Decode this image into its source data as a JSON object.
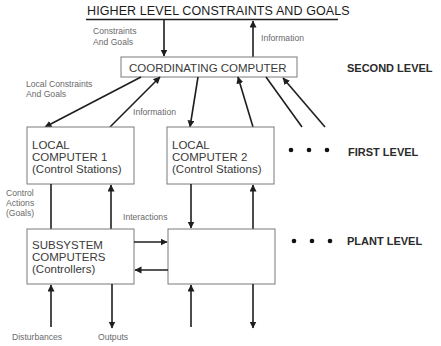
{
  "title": "HIGHER LEVEL CONSTRAINTS AND GOALS",
  "boxes": {
    "coordinating": {
      "label": "COORDINATING COMPUTER"
    },
    "local1": {
      "line1": "LOCAL",
      "line2": "COMPUTER 1",
      "line3": "(Control Stations)"
    },
    "local2": {
      "line1": "LOCAL",
      "line2": "COMPUTER 2",
      "line3": "(Control Stations)"
    },
    "subsystem": {
      "line1": "SUBSYSTEM",
      "line2": "COMPUTERS",
      "line3": "(Controllers)"
    },
    "plant": {
      "label": ""
    }
  },
  "labels": {
    "constraints_goals_1": "Constraints",
    "constraints_goals_2": "And Goals",
    "information_top": "Information",
    "local_constraints_1": "Local Constraints",
    "local_constraints_2": "And Goals",
    "information_mid": "Information",
    "control_actions_1": "Control",
    "control_actions_2": "Actions",
    "control_actions_3": "(Goals)",
    "interactions": "Interactions",
    "disturbances": "Disturbances",
    "outputs": "Outputs"
  },
  "levels": {
    "second": "SECOND LEVEL",
    "first": "FIRST LEVEL",
    "plant": "PLANT LEVEL"
  },
  "ellipsis_dots": 3
}
